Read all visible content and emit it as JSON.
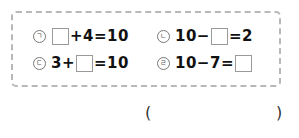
{
  "problems": [
    {
      "marker": "ㄱ",
      "before": "",
      "after": "+4=10"
    },
    {
      "marker": "ㄴ",
      "before": "10−",
      "after": "=2"
    },
    {
      "marker": "ㄷ",
      "before": "3+",
      "after": "=10"
    },
    {
      "marker": "ㄹ",
      "before": "10−7=",
      "after": ""
    }
  ],
  "answer": {
    "open": "(",
    "close": ")",
    "value": ""
  }
}
